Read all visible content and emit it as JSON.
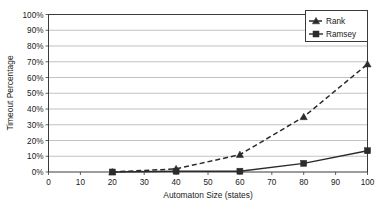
{
  "chart_data": {
    "type": "line",
    "title": "",
    "xlabel": "Automaton Size (states)",
    "ylabel": "Timeout Percentage",
    "x": [
      20,
      40,
      60,
      80,
      100
    ],
    "xlim": [
      0,
      100
    ],
    "ylim": [
      0,
      100
    ],
    "xticks": [
      0,
      10,
      20,
      30,
      40,
      50,
      60,
      70,
      80,
      90,
      100
    ],
    "xtick_labels": [
      "0",
      "10",
      "20",
      "30",
      "40",
      "50",
      "60",
      "70",
      "80",
      "90",
      "100"
    ],
    "yticks": [
      0,
      10,
      20,
      30,
      40,
      50,
      60,
      70,
      80,
      90,
      100
    ],
    "ytick_labels": [
      "0%",
      "10%",
      "20%",
      "30%",
      "40%",
      "50%",
      "60%",
      "70%",
      "80%",
      "90%",
      "100%"
    ],
    "grid": "horizontal",
    "legend_position": "top-right",
    "series": [
      {
        "name": "Rank",
        "values": [
          0,
          2,
          11,
          35,
          68.5
        ],
        "marker": "triangle",
        "line_style": "dashed",
        "color": "#2b2b2b"
      },
      {
        "name": "Ramsey",
        "values": [
          0,
          0.5,
          0.5,
          5.5,
          13.5
        ],
        "marker": "square",
        "line_style": "solid",
        "color": "#2b2b2b"
      }
    ]
  },
  "legend": {
    "entries": [
      {
        "label": "Rank",
        "marker": "triangle-marker"
      },
      {
        "label": "Ramsey",
        "marker": "square-marker"
      }
    ]
  },
  "axes": {
    "x_title": "Automaton Size (states)",
    "y_title": "Timeout Percentage"
  }
}
